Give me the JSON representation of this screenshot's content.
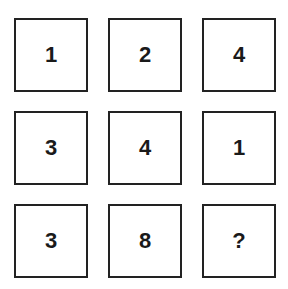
{
  "puzzle": {
    "grid": [
      [
        "1",
        "2",
        "4"
      ],
      [
        "3",
        "4",
        "1"
      ],
      [
        "3",
        "8",
        "?"
      ]
    ]
  }
}
